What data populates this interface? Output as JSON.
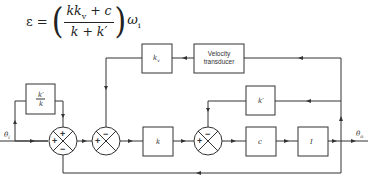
{
  "equation": {
    "lhs": "ε =",
    "numerator": "kk",
    "numerator_sub": "v",
    "numerator_rest": " + c",
    "denominator": "k + k′",
    "left_paren": "(",
    "right_paren": ")",
    "factor": "ω",
    "factor_sub": "i"
  },
  "blocks": {
    "feedforward": {
      "label": "k′/k",
      "num": "k′",
      "den": "k"
    },
    "kv": {
      "label": "k",
      "sub": "v"
    },
    "velocity_transducer": {
      "line1": "Velocity",
      "line2": "transducer"
    },
    "k_gain": {
      "label": "k"
    },
    "k_prime": {
      "label": "k′"
    },
    "c_gain": {
      "label": "c"
    },
    "inertia": {
      "label": "I"
    }
  },
  "signals": {
    "input": {
      "label": "θ",
      "sub": "i"
    },
    "output": {
      "label": "θ",
      "sub": "o"
    }
  },
  "summing_junctions": {
    "sj1": {
      "top": "+",
      "left": "+",
      "bottom": "−"
    },
    "sj2": {
      "top": "−",
      "left": "+"
    },
    "sj3": {
      "top": "−",
      "left": "+"
    }
  }
}
